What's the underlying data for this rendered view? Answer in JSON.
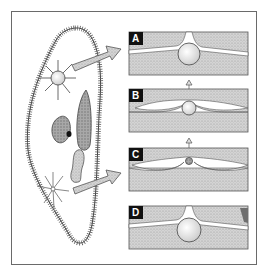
{
  "diagram": {
    "panels": [
      {
        "label": "A"
      },
      {
        "label": "B"
      },
      {
        "label": "C"
      },
      {
        "label": "D"
      }
    ],
    "colors": {
      "frame": "#6a6a6a",
      "stipple": "#c9c9c9",
      "organelle": "#a9a9a9",
      "label_bg": "#111111",
      "label_text": "#ffffff"
    }
  }
}
